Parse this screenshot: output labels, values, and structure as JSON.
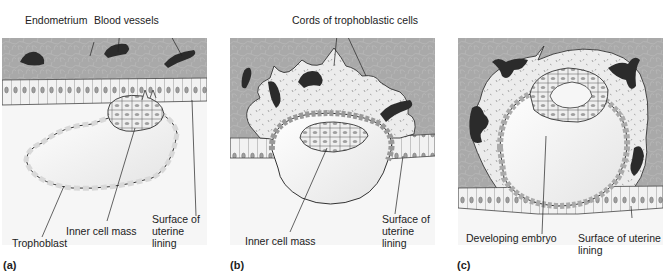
{
  "figure": {
    "colors": {
      "endometrium": "#a9a9a9",
      "endometrium_cell_lines": "#bdbdbd",
      "blood_vessel": "#2b2b2b",
      "epithelium": "#f0f0f0",
      "lumen": "#f4f4f4",
      "trophoblast_fill": "#e6e6e6",
      "cell_nucleus": "#9a9a9a",
      "outline": "#333333"
    },
    "panels": [
      {
        "letter": "(a)",
        "labels": {
          "endometrium": "Endometrium",
          "blood_vessels": "Blood vessels",
          "inner_cell_mass": "Inner cell mass",
          "trophoblast": "Trophoblast",
          "surface_line1": "Surface of",
          "surface_line2": "uterine",
          "surface_line3": "lining"
        }
      },
      {
        "letter": "(b)",
        "labels": {
          "cords": "Cords of trophoblastic cells",
          "inner_cell_mass": "Inner cell mass",
          "surface_line1": "Surface of",
          "surface_line2": "uterine",
          "surface_line3": "lining"
        }
      },
      {
        "letter": "(c)",
        "labels": {
          "developing_embryo": "Developing embryo",
          "surface_line1": "Surface of uterine",
          "surface_line2": "lining"
        }
      }
    ]
  }
}
